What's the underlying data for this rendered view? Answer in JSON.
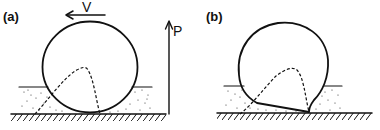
{
  "figure": {
    "panels": [
      {
        "id": "a",
        "label": "(a)",
        "description": "rigid wheel on soft soil",
        "velocity_label": "V",
        "load_label": "P"
      },
      {
        "id": "b",
        "label": "(b)",
        "description": "deformable tire on soft soil"
      }
    ],
    "colors": {
      "ink": "#111111",
      "background": "#ffffff"
    }
  }
}
